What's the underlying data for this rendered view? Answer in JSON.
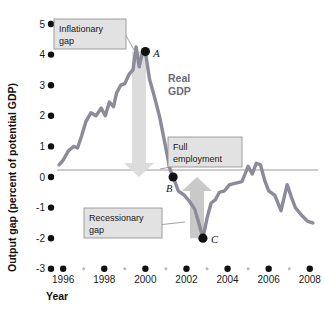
{
  "chart_data": {
    "type": "line",
    "title": "",
    "xlabel": "Year",
    "ylabel": "Output gap (percent of potential GDP)",
    "xlim": [
      1995.7,
      2008.4
    ],
    "ylim": [
      -3,
      5
    ],
    "grid": false,
    "legend": "none",
    "series": [
      {
        "name": "Real GDP",
        "color": "#8b8b99",
        "x": [
          1995.8,
          1996.0,
          1996.25,
          1996.5,
          1996.7,
          1996.9,
          1997.1,
          1997.35,
          1997.6,
          1997.85,
          1998.05,
          1998.25,
          1998.45,
          1998.6,
          1998.8,
          1999.0,
          1999.2,
          1999.4,
          1999.55,
          1999.7,
          1999.85,
          2000.0,
          2000.2,
          2000.45,
          2000.7,
          2000.95,
          2001.2,
          2001.35,
          2001.6,
          2001.9,
          2002.15,
          2002.4,
          2002.6,
          2002.8,
          2003.0,
          2003.2,
          2003.4,
          2003.6,
          2003.85,
          2004.1,
          2004.4,
          2004.7,
          2005.0,
          2005.2,
          2005.4,
          2005.6,
          2005.8,
          2006.0,
          2006.3,
          2006.6,
          2006.9,
          2007.1,
          2007.3,
          2007.6,
          2007.9,
          2008.15
        ],
        "y": [
          0.4,
          0.55,
          0.85,
          1.0,
          0.95,
          1.35,
          1.8,
          2.1,
          2.0,
          2.25,
          2.0,
          2.45,
          2.3,
          2.75,
          3.0,
          3.05,
          3.35,
          3.5,
          4.25,
          3.6,
          4.05,
          4.1,
          3.2,
          2.6,
          1.95,
          1.1,
          0.25,
          0.0,
          -0.45,
          -0.6,
          -0.8,
          -1.05,
          -1.5,
          -2.0,
          -1.35,
          -0.85,
          -0.75,
          -0.5,
          -0.45,
          -0.25,
          -0.2,
          -0.15,
          0.35,
          0.1,
          0.45,
          0.4,
          -0.1,
          -0.45,
          -0.6,
          -1.1,
          -0.25,
          -0.65,
          -1.0,
          -1.25,
          -1.45,
          -1.5
        ]
      }
    ],
    "y_ticks": [
      5,
      4,
      3,
      2,
      1,
      0,
      -1,
      -2,
      -3
    ],
    "y_tick_labels": [
      "5",
      "4",
      "3",
      "2",
      "1",
      "0",
      "-1",
      "-2",
      "-3"
    ],
    "x_ticks": [
      1996,
      1998,
      2000,
      2002,
      2004,
      2006,
      2008
    ],
    "x_tick_labels": [
      "1996",
      "1998",
      "2000",
      "2002",
      "2004",
      "2006",
      "2008"
    ],
    "x_minor_ticks": [
      1997,
      1999,
      2001,
      2003,
      2005,
      2007
    ],
    "zero_line": 0,
    "points": [
      {
        "label": "A",
        "x": 2000.0,
        "y": 4.1
      },
      {
        "label": "B",
        "x": 2001.35,
        "y": 0.0
      },
      {
        "label": "C",
        "x": 2002.8,
        "y": -2.0
      }
    ],
    "annotations": [
      {
        "name": "inflationary-gap",
        "text_line1": "Inflationary",
        "text_line2": "gap",
        "box": {
          "x": 54,
          "y": 19,
          "w": 72,
          "h": 30
        },
        "leader_to": {
          "x": 134,
          "y": 50
        }
      },
      {
        "name": "full-employment",
        "text_line1": "Full",
        "text_line2": "employment",
        "box": {
          "x": 168,
          "y": 137,
          "w": 74,
          "h": 30
        },
        "leader_to": {
          "x": 160,
          "y": 169
        }
      },
      {
        "name": "recessionary-gap",
        "text_line1": "Recessionary",
        "text_line2": "gap",
        "box": {
          "x": 84,
          "y": 208,
          "w": 78,
          "h": 30
        },
        "leader_to": {
          "x": 185,
          "y": 222
        }
      }
    ],
    "arrows": [
      {
        "name": "inflationary-gap-arrow",
        "direction": "down",
        "x": 139,
        "y_from": 4.1,
        "y_to": 0.0,
        "color": "#dcdcdc"
      },
      {
        "name": "recessionary-gap-arrow",
        "direction": "up",
        "x": 197,
        "y_from": -2.0,
        "y_to": 0.0,
        "color": "#c9c9c9"
      }
    ],
    "series_label": {
      "text_line1": "Real",
      "text_line2": "GDP",
      "x": 168,
      "y": 82
    },
    "colors": {
      "line": "#8b8b99",
      "marker": "#111111",
      "zero_line": "#9a9a9a",
      "callout_box_fill": "#e2e2e2",
      "callout_box_border": "#8a8a8a",
      "background": "#ffffff"
    }
  },
  "axes": {
    "y_axis_title": "Output gap (percent of potential GDP)",
    "x_axis_title": "Year"
  }
}
